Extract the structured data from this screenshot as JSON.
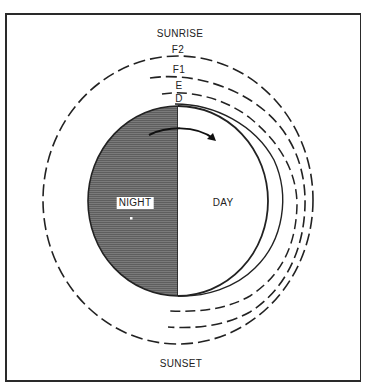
{
  "labels": {
    "sunrise": "SUNRISE",
    "sunset": "SUNSET",
    "night": "NIGHT",
    "day": "DAY",
    "layers": {
      "f2": "F2",
      "f1": "F1",
      "e": "E",
      "d": "D"
    }
  },
  "colors": {
    "night_fill": "#6e6e6e",
    "stroke": "#222222",
    "frame": "#2a2a2a"
  }
}
